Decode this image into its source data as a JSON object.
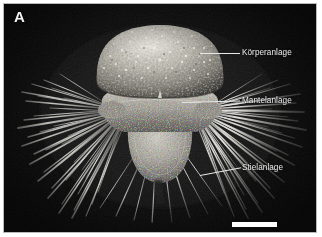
{
  "figure": {
    "panel_letter": "A",
    "background_color": "#090909",
    "frame_color": "#b9b9b9",
    "page_color": "#ffffff",
    "annotation_text_color": "#ededed",
    "leader_line_color": "#e8e8e8",
    "scale_bar_color": "#ffffff",
    "specimen_highlight_color": "#e8e6e0",
    "specimen_midtone_color": "#9a968d",
    "specimen_shadow_color": "#3a3934",
    "seta_color": "#f0efe9"
  },
  "annotations": [
    {
      "id": "korperanlage",
      "label": "Körperanlage",
      "leader_from_x": 196,
      "leader_from_y": 49,
      "leader_to_x": 236,
      "leader_to_y": 49
    },
    {
      "id": "mantelanlage",
      "label": "Mantelanlage",
      "leader_from_x": 178,
      "leader_from_y": 99,
      "leader_to_x": 236,
      "leader_to_y": 97
    },
    {
      "id": "stielanlage",
      "label": "Stielanlage",
      "leader_from_x": 196,
      "leader_from_y": 171,
      "leader_to_x": 237,
      "leader_to_y": 163
    }
  ],
  "scale_bar": {
    "label": "",
    "x": 228,
    "y": 218,
    "width": 45,
    "height": 5
  }
}
